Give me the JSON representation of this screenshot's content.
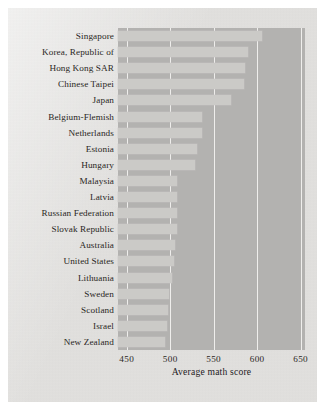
{
  "chart_data": {
    "type": "bar",
    "orientation": "horizontal",
    "title": "",
    "xlabel": "Average math score",
    "ylabel": "",
    "xlim": [
      440,
      655
    ],
    "xticks": [
      450,
      500,
      550,
      600,
      650
    ],
    "grid": "vertical-only",
    "legend": "none",
    "categories": [
      "Singapore",
      "Korea, Republic of",
      "Hong Kong SAR",
      "Chinese Taipei",
      "Japan",
      "Belgium-Flemish",
      "Netherlands",
      "Estonia",
      "Hungary",
      "Malaysia",
      "Latvia",
      "Russian Federation",
      "Slovak Republic",
      "Australia",
      "United States",
      "Lithuania",
      "Sweden",
      "Scotland",
      "Israel",
      "New Zealand"
    ],
    "values": [
      605,
      589,
      586,
      585,
      570,
      537,
      536,
      531,
      529,
      508,
      508,
      508,
      508,
      505,
      504,
      502,
      499,
      498,
      496,
      494
    ],
    "bar_color": "#cbcac7",
    "plot_background": "#b3b2b0",
    "gridline_color": "#f2f1ef",
    "figure_background": "#e8e7e5"
  },
  "axis": {
    "x_title": "Average math score",
    "tick_labels": [
      "450",
      "500",
      "550",
      "600",
      "650"
    ]
  }
}
